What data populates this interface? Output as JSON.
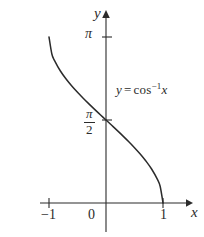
{
  "figure": {
    "title_text": "",
    "background_color": "#ffffff",
    "ink_color": "#2b2b2b"
  },
  "axes": {
    "y_axis_name": "y",
    "x_axis_name": "x",
    "y_ticks": [
      {
        "label": "π",
        "value": 3.14159
      },
      {
        "label_numerator": "π",
        "label_denominator": "2",
        "value": 1.5708
      }
    ],
    "x_ticks": [
      {
        "label": "−1",
        "value": -1
      },
      {
        "label": "0",
        "value": 0
      },
      {
        "label": "1",
        "value": 1
      }
    ]
  },
  "annotation": {
    "lhs": "y",
    "equals": "=",
    "fn": "cos",
    "exponent": "−1",
    "arg": "x",
    "full_text": "y = cos−1x"
  },
  "chart_data": {
    "type": "line",
    "title": "",
    "xlabel": "x",
    "ylabel": "y",
    "xlim": [
      -1.35,
      1.45
    ],
    "ylim": [
      -0.55,
      3.75
    ],
    "grid": false,
    "legend": "none",
    "annotations": [
      {
        "text": "y = cos−1x",
        "x": 0.2,
        "y": 2.3
      }
    ],
    "xtick_labels": [
      "−1",
      "0",
      "1"
    ],
    "xtick_values": [
      -1,
      0,
      1
    ],
    "ytick_labels": [
      "π/2",
      "π"
    ],
    "ytick_values": [
      1.5708,
      3.14159
    ],
    "series": [
      {
        "name": "y = cos^-1 x",
        "color": "#2b2b2b",
        "x": [
          -1.0,
          -0.95,
          -0.9,
          -0.8,
          -0.7,
          -0.6,
          -0.5,
          -0.4,
          -0.3,
          -0.2,
          -0.1,
          0.0,
          0.1,
          0.2,
          0.3,
          0.4,
          0.5,
          0.6,
          0.7,
          0.8,
          0.9,
          0.95,
          1.0
        ],
        "y": [
          3.1416,
          2.8198,
          2.6906,
          2.4981,
          2.3462,
          2.2143,
          2.0944,
          1.9823,
          1.8755,
          1.7722,
          1.671,
          1.5708,
          1.4706,
          1.3694,
          1.2661,
          1.1593,
          1.0472,
          0.9273,
          0.7954,
          0.6435,
          0.451,
          0.3176,
          0.0
        ]
      }
    ]
  },
  "pixel_geometry": {
    "y_axis_x_px": 106,
    "x_axis_y_px": 203,
    "x_neg1_px": 49,
    "x_pos1_px": 163,
    "y_pi_px": 37,
    "y_pihalf_px": 120
  }
}
